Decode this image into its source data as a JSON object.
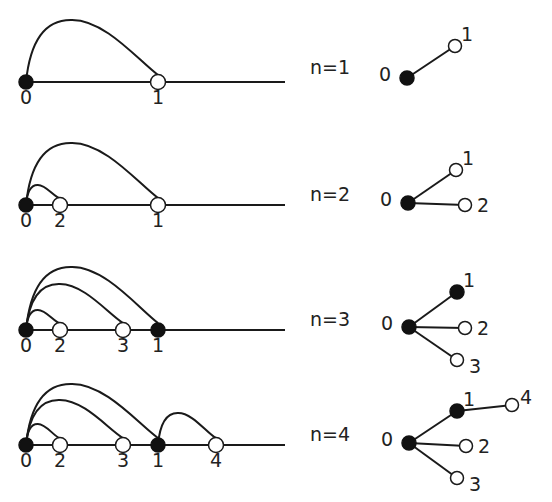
{
  "diagram": {
    "colors": {
      "stroke": "#1a1a1a",
      "filled_node": "#111111",
      "open_node": "#ffffff",
      "text": "#222222"
    },
    "panels": [
      {
        "n_label": "n=1",
        "line": {
          "y": 82,
          "x_start": 26,
          "x_end": 285,
          "nodes": [
            {
              "id": "0",
              "x": 26,
              "filled": true
            },
            {
              "id": "1",
              "x": 158,
              "filled": false
            }
          ],
          "arcs": [
            {
              "from": "0",
              "to": "1",
              "peak_y": 20
            }
          ]
        },
        "tree": {
          "nodes": [
            {
              "id": "0",
              "x": 407,
              "y": 78,
              "filled": true,
              "label_dx": -22,
              "label_dy": -4
            },
            {
              "id": "1",
              "x": 455,
              "y": 46,
              "filled": false,
              "label_dx": 6,
              "label_dy": -12
            }
          ],
          "edges": [
            [
              "0",
              "1"
            ]
          ]
        }
      },
      {
        "n_label": "n=2",
        "line": {
          "y": 205,
          "x_start": 26,
          "x_end": 285,
          "nodes": [
            {
              "id": "0",
              "x": 26,
              "filled": true
            },
            {
              "id": "2",
              "x": 60,
              "filled": false
            },
            {
              "id": "1",
              "x": 158,
              "filled": false
            }
          ],
          "arcs": [
            {
              "from": "0",
              "to": "1",
              "peak_y": 143
            },
            {
              "from": "0",
              "to": "2",
              "peak_y": 185
            }
          ]
        },
        "tree": {
          "nodes": [
            {
              "id": "0",
              "x": 408,
              "y": 203,
              "filled": true,
              "label_dx": -22,
              "label_dy": -4
            },
            {
              "id": "1",
              "x": 456,
              "y": 170,
              "filled": false,
              "label_dx": 6,
              "label_dy": -12
            },
            {
              "id": "2",
              "x": 465,
              "y": 205,
              "filled": false,
              "label_dx": 12,
              "label_dy": 0
            }
          ],
          "edges": [
            [
              "0",
              "1"
            ],
            [
              "0",
              "2"
            ]
          ]
        }
      },
      {
        "n_label": "n=3",
        "line": {
          "y": 330,
          "x_start": 26,
          "x_end": 285,
          "nodes": [
            {
              "id": "0",
              "x": 26,
              "filled": true
            },
            {
              "id": "2",
              "x": 60,
              "filled": false
            },
            {
              "id": "3",
              "x": 123,
              "filled": false
            },
            {
              "id": "1",
              "x": 158,
              "filled": true
            }
          ],
          "arcs": [
            {
              "from": "0",
              "to": "1",
              "peak_y": 267
            },
            {
              "from": "0",
              "to": "3",
              "peak_y": 284
            },
            {
              "from": "0",
              "to": "2",
              "peak_y": 310
            }
          ]
        },
        "tree": {
          "nodes": [
            {
              "id": "0",
              "x": 409,
              "y": 327,
              "filled": true,
              "label_dx": -22,
              "label_dy": -4
            },
            {
              "id": "1",
              "x": 457,
              "y": 292,
              "filled": true,
              "label_dx": 6,
              "label_dy": -12
            },
            {
              "id": "2",
              "x": 465,
              "y": 328,
              "filled": false,
              "label_dx": 12,
              "label_dy": 0
            },
            {
              "id": "3",
              "x": 457,
              "y": 360,
              "filled": false,
              "label_dx": 12,
              "label_dy": 6
            }
          ],
          "edges": [
            [
              "0",
              "1"
            ],
            [
              "0",
              "2"
            ],
            [
              "0",
              "3"
            ]
          ]
        }
      },
      {
        "n_label": "n=4",
        "line": {
          "y": 445,
          "x_start": 26,
          "x_end": 285,
          "nodes": [
            {
              "id": "0",
              "x": 26,
              "filled": true
            },
            {
              "id": "2",
              "x": 60,
              "filled": false
            },
            {
              "id": "3",
              "x": 123,
              "filled": false
            },
            {
              "id": "1",
              "x": 158,
              "filled": true
            },
            {
              "id": "4",
              "x": 216,
              "filled": false
            }
          ],
          "arcs": [
            {
              "from": "0",
              "to": "1",
              "peak_y": 384
            },
            {
              "from": "0",
              "to": "3",
              "peak_y": 400
            },
            {
              "from": "0",
              "to": "2",
              "peak_y": 424
            },
            {
              "from": "1",
              "to": "4",
              "peak_y": 413
            }
          ]
        },
        "tree": {
          "nodes": [
            {
              "id": "0",
              "x": 409,
              "y": 443,
              "filled": true,
              "label_dx": -22,
              "label_dy": -4
            },
            {
              "id": "1",
              "x": 457,
              "y": 411,
              "filled": true,
              "label_dx": 6,
              "label_dy": -12
            },
            {
              "id": "4",
              "x": 512,
              "y": 405,
              "filled": false,
              "label_dx": 8,
              "label_dy": -8
            },
            {
              "id": "2",
              "x": 466,
              "y": 446,
              "filled": false,
              "label_dx": 12,
              "label_dy": 0
            },
            {
              "id": "3",
              "x": 457,
              "y": 478,
              "filled": false,
              "label_dx": 12,
              "label_dy": 6
            }
          ],
          "edges": [
            [
              "0",
              "1"
            ],
            [
              "1",
              "4"
            ],
            [
              "0",
              "2"
            ],
            [
              "0",
              "3"
            ]
          ]
        }
      }
    ],
    "n_label_x": 310,
    "label_offset_y": 22
  }
}
